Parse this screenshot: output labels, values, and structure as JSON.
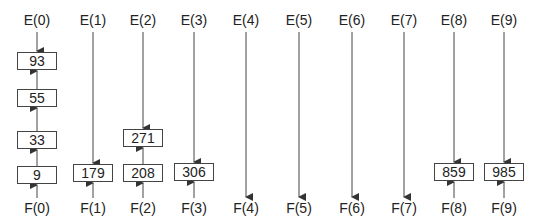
{
  "diagram": {
    "columns": [
      {
        "top": "E(0)",
        "bottom": "F(0)",
        "x": 37,
        "nodes": [
          {
            "value": "93",
            "y": 52
          },
          {
            "value": "55",
            "y": 89
          },
          {
            "value": "33",
            "y": 131
          },
          {
            "value": "9",
            "y": 166
          }
        ],
        "direction": "up-from-F",
        "e_arrow_to": 52
      },
      {
        "top": "E(1)",
        "bottom": "F(1)",
        "x": 93,
        "nodes": [
          {
            "value": "179",
            "y": 164
          }
        ],
        "direction": "meet"
      },
      {
        "top": "E(2)",
        "bottom": "F(2)",
        "x": 143,
        "nodes": [
          {
            "value": "271",
            "y": 129
          },
          {
            "value": "208",
            "y": 164
          }
        ],
        "direction": "meet"
      },
      {
        "top": "E(3)",
        "bottom": "F(3)",
        "x": 194,
        "nodes": [
          {
            "value": "306",
            "y": 163
          }
        ],
        "direction": "meet"
      },
      {
        "top": "E(4)",
        "bottom": "F(4)",
        "x": 246,
        "nodes": [],
        "direction": "down"
      },
      {
        "top": "E(5)",
        "bottom": "F(5)",
        "x": 299,
        "nodes": [],
        "direction": "down"
      },
      {
        "top": "E(6)",
        "bottom": "F(6)",
        "x": 352,
        "nodes": [],
        "direction": "down"
      },
      {
        "top": "E(7)",
        "bottom": "F(7)",
        "x": 404,
        "nodes": [],
        "direction": "down"
      },
      {
        "top": "E(8)",
        "bottom": "F(8)",
        "x": 454,
        "nodes": [
          {
            "value": "859",
            "y": 163
          }
        ],
        "direction": "meet"
      },
      {
        "top": "E(9)",
        "bottom": "F(9)",
        "x": 504,
        "nodes": [
          {
            "value": "985",
            "y": 163
          }
        ],
        "direction": "meet"
      }
    ],
    "line_color": "#444444"
  }
}
